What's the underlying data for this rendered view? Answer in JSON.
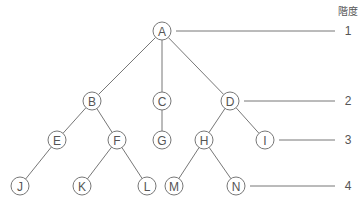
{
  "header": "階度",
  "nodes": [
    {
      "id": "A",
      "x": 162,
      "y": 31
    },
    {
      "id": "B",
      "x": 92,
      "y": 101
    },
    {
      "id": "C",
      "x": 162,
      "y": 101
    },
    {
      "id": "D",
      "x": 230,
      "y": 101
    },
    {
      "id": "E",
      "x": 57,
      "y": 140
    },
    {
      "id": "F",
      "x": 117,
      "y": 140
    },
    {
      "id": "G",
      "x": 162,
      "y": 140
    },
    {
      "id": "H",
      "x": 204,
      "y": 140
    },
    {
      "id": "I",
      "x": 265,
      "y": 140
    },
    {
      "id": "J",
      "x": 20,
      "y": 186
    },
    {
      "id": "K",
      "x": 82,
      "y": 186
    },
    {
      "id": "L",
      "x": 147,
      "y": 186
    },
    {
      "id": "M",
      "x": 174,
      "y": 186
    },
    {
      "id": "N",
      "x": 236,
      "y": 186
    }
  ],
  "edges": [
    [
      "A",
      "B"
    ],
    [
      "A",
      "C"
    ],
    [
      "A",
      "D"
    ],
    [
      "B",
      "E"
    ],
    [
      "B",
      "F"
    ],
    [
      "C",
      "G"
    ],
    [
      "D",
      "H"
    ],
    [
      "D",
      "I"
    ],
    [
      "E",
      "J"
    ],
    [
      "F",
      "K"
    ],
    [
      "F",
      "L"
    ],
    [
      "H",
      "M"
    ],
    [
      "H",
      "N"
    ]
  ],
  "levels": [
    {
      "label": "1",
      "from": "A",
      "y": 31
    },
    {
      "label": "2",
      "from": "D",
      "y": 101
    },
    {
      "label": "3",
      "from": "I",
      "y": 140
    },
    {
      "label": "4",
      "from": "N",
      "y": 186
    }
  ]
}
